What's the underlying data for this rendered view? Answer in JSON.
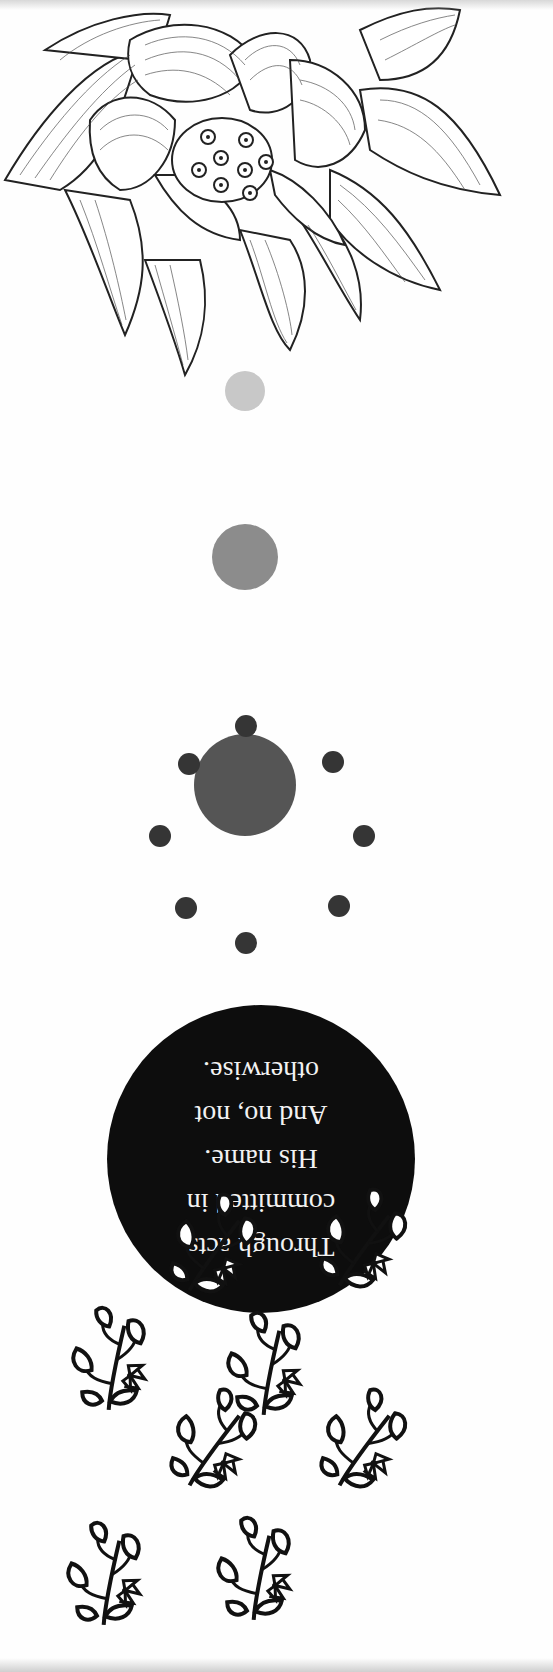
{
  "page": {
    "orientation": "upside-down",
    "background": "#fefefe"
  },
  "illustrations": {
    "lotus": {
      "name": "lotus-flower-drawing",
      "style": "pen-and-ink hatched"
    },
    "progression_circles": [
      {
        "label": "small-light-circle",
        "cx": 245,
        "cy": 391,
        "r": 20,
        "color": "#c8c8c8"
      },
      {
        "label": "medium-gray-circle",
        "cx": 245,
        "cy": 557,
        "r": 33,
        "color": "#8c8c8c"
      },
      {
        "label": "large-dark-circle",
        "cx": 245,
        "cy": 785,
        "r": 51,
        "color": "#555555"
      }
    ],
    "orbit_dots": {
      "count": 8,
      "color": "#353535",
      "r": 11
    },
    "vines": {
      "name": "hanging-vine-pattern",
      "count": 10,
      "color": "#111111"
    }
  },
  "quote": {
    "background": "#0d0d0d",
    "text_color": "#f2f2f2",
    "lines": [
      "Through acts",
      "committed in",
      "His name.",
      "And no, not",
      "otherwise."
    ]
  }
}
